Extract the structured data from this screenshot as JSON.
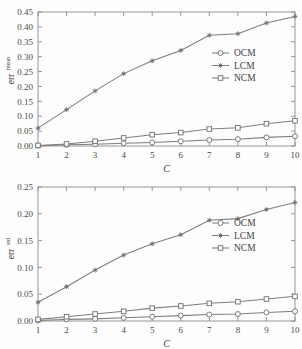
{
  "figure": {
    "background_color": "#fdfdfd",
    "line_color": "#7e7e7e",
    "axis_color": "#8d8d8d",
    "text_color": "#3f3f3f"
  },
  "panels": [
    {
      "id": "top",
      "ylabel": "err",
      "ylabel_superscript": "mean",
      "xlabel": "C",
      "legend": [
        "OCM",
        "LCM",
        "NCM"
      ],
      "y_ticks": [
        "0.00",
        "0.05",
        "0.10",
        "0.15",
        "0.20",
        "0.25",
        "0.30",
        "0.35",
        "0.40",
        "0.45"
      ],
      "x_ticks": [
        "1",
        "2",
        "3",
        "4",
        "5",
        "6",
        "7",
        "8",
        "9",
        "10"
      ]
    },
    {
      "id": "bottom",
      "ylabel": "err",
      "ylabel_superscript": "std",
      "xlabel": "C",
      "legend": [
        "OCM",
        "LCM",
        "NCM"
      ],
      "y_ticks": [
        "0.00",
        "0.05",
        "0.10",
        "0.15",
        "0.20",
        "0.25"
      ],
      "x_ticks": [
        "1",
        "2",
        "3",
        "4",
        "5",
        "6",
        "7",
        "8",
        "9",
        "10"
      ]
    }
  ],
  "chart_data": [
    {
      "type": "line",
      "title": "",
      "xlabel": "C",
      "ylabel": "err^mean",
      "x": [
        1,
        2,
        3,
        4,
        5,
        6,
        7,
        8,
        9,
        10
      ],
      "xlim": [
        1,
        10
      ],
      "ylim": [
        0.0,
        0.45
      ],
      "yticks": [
        0.0,
        0.05,
        0.1,
        0.15,
        0.2,
        0.25,
        0.3,
        0.35,
        0.4,
        0.45
      ],
      "xticks": [
        1,
        2,
        3,
        4,
        5,
        6,
        7,
        8,
        9,
        10
      ],
      "grid": false,
      "legend_position": "center-right",
      "series": [
        {
          "name": "OCM",
          "marker": "circle",
          "values": [
            0.001,
            0.004,
            0.006,
            0.009,
            0.012,
            0.016,
            0.02,
            0.023,
            0.029,
            0.033
          ]
        },
        {
          "name": "LCM",
          "marker": "asterisk",
          "values": [
            0.06,
            0.122,
            0.185,
            0.243,
            0.286,
            0.321,
            0.372,
            0.377,
            0.413,
            0.435
          ]
        },
        {
          "name": "NCM",
          "marker": "square",
          "values": [
            0.002,
            0.007,
            0.016,
            0.027,
            0.038,
            0.045,
            0.057,
            0.061,
            0.075,
            0.085
          ]
        }
      ]
    },
    {
      "type": "line",
      "title": "",
      "xlabel": "C",
      "ylabel": "err^std",
      "x": [
        1,
        2,
        3,
        4,
        5,
        6,
        7,
        8,
        9,
        10
      ],
      "xlim": [
        1,
        10
      ],
      "ylim": [
        0.0,
        0.25
      ],
      "yticks": [
        0.0,
        0.05,
        0.1,
        0.15,
        0.2,
        0.25
      ],
      "xticks": [
        1,
        2,
        3,
        4,
        5,
        6,
        7,
        8,
        9,
        10
      ],
      "grid": false,
      "legend_position": "center-right",
      "series": [
        {
          "name": "OCM",
          "marker": "circle",
          "values": [
            0.001,
            0.003,
            0.004,
            0.006,
            0.008,
            0.01,
            0.012,
            0.013,
            0.016,
            0.018
          ]
        },
        {
          "name": "LCM",
          "marker": "asterisk",
          "values": [
            0.035,
            0.064,
            0.095,
            0.123,
            0.144,
            0.161,
            0.188,
            0.191,
            0.208,
            0.221
          ]
        },
        {
          "name": "NCM",
          "marker": "square",
          "values": [
            0.003,
            0.008,
            0.013,
            0.018,
            0.024,
            0.028,
            0.033,
            0.036,
            0.041,
            0.046
          ]
        }
      ]
    }
  ]
}
